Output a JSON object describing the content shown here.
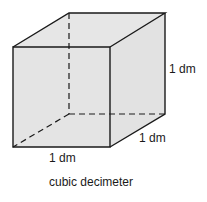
{
  "diagram": {
    "title": "cubic decimeter",
    "labels": {
      "height": "1 dm",
      "depth": "1 dm",
      "width": "1 dm"
    },
    "colors": {
      "fill": "#e4e4e4",
      "stroke": "#1a1a1a"
    }
  }
}
